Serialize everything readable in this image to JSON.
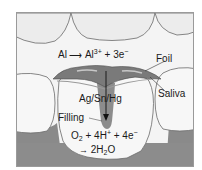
{
  "figure": {
    "labels": {
      "anode_reaction": {
        "left": "Al",
        "arrow": "→",
        "right": "Al",
        "right_sup": "3+",
        "rest": " + 3e",
        "rest_sup": "−"
      },
      "foil": "Foil",
      "saliva": "Saliva",
      "filling_alloy": "Ag/Sn/Hg",
      "filling": "Filling",
      "cathode_reaction_line1": {
        "a": "O",
        "a_sub": "2",
        "b": " + 4H",
        "b_sup": "+",
        "c": " + 4e",
        "c_sup": "−"
      },
      "cathode_reaction_line2": {
        "arrow": "→",
        "a": " 2H",
        "a_sub": "2",
        "b": "O"
      }
    },
    "colors": {
      "tooth": "#f7f7f7",
      "gum": "#8a8a8a",
      "foil": "#7a7a7a",
      "filling": "#8c8c8c",
      "outline": "#555555"
    }
  }
}
